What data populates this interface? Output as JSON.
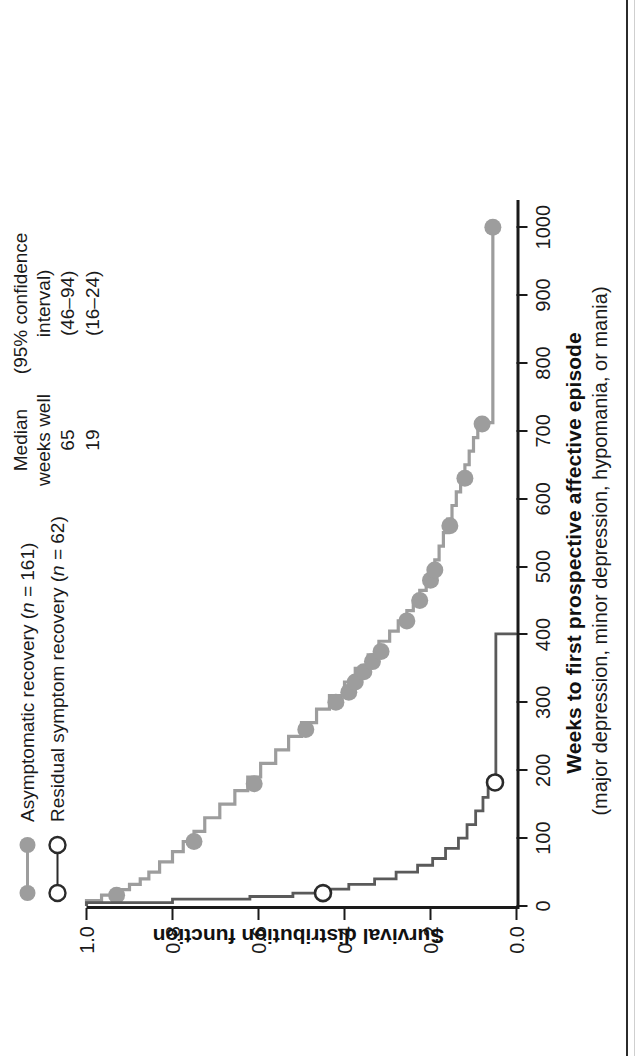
{
  "chart_data": {
    "type": "line",
    "title": "",
    "xlabel": "Weeks to first prospective affective episode",
    "xsublabel": "(major depression, minor depression, hypomania, or mania)",
    "ylabel": "Survival distribution function",
    "xlim": [
      0,
      1040
    ],
    "ylim": [
      0,
      1.0
    ],
    "xticks": [
      0,
      100,
      200,
      300,
      400,
      500,
      600,
      700,
      800,
      900,
      1000
    ],
    "xticklabels": [
      "0",
      "100",
      "200",
      "300",
      "400",
      "500",
      "600",
      "700",
      "800",
      "900",
      "1000"
    ],
    "yticks": [
      0.0,
      0.2,
      0.4,
      0.6,
      0.8,
      1.0
    ],
    "yticklabels": [
      "0.0",
      "0.2",
      "0.4",
      "0.6",
      "0.8",
      "1.0"
    ],
    "grid": false,
    "legend_position": "top-left",
    "series": [
      {
        "name": "Asymptomatic recovery (n=161)",
        "label_plain": "Asymptomatic recovery (",
        "label_italic": "n",
        "label_tail": " = 161)",
        "color": "#9d9d9d",
        "marker": "filled-circle",
        "points": [
          [
            0,
            1.0
          ],
          [
            8,
            0.965
          ],
          [
            16,
            0.93
          ],
          [
            24,
            0.9
          ],
          [
            32,
            0.875
          ],
          [
            40,
            0.855
          ],
          [
            50,
            0.83
          ],
          [
            65,
            0.8
          ],
          [
            80,
            0.775
          ],
          [
            95,
            0.75
          ],
          [
            110,
            0.725
          ],
          [
            130,
            0.69
          ],
          [
            150,
            0.655
          ],
          [
            170,
            0.625
          ],
          [
            190,
            0.595
          ],
          [
            210,
            0.56
          ],
          [
            230,
            0.53
          ],
          [
            250,
            0.5
          ],
          [
            270,
            0.465
          ],
          [
            290,
            0.435
          ],
          [
            310,
            0.4
          ],
          [
            330,
            0.375
          ],
          [
            350,
            0.345
          ],
          [
            370,
            0.32
          ],
          [
            390,
            0.295
          ],
          [
            405,
            0.275
          ],
          [
            420,
            0.255
          ],
          [
            435,
            0.24
          ],
          [
            450,
            0.225
          ],
          [
            465,
            0.21
          ],
          [
            480,
            0.2
          ],
          [
            495,
            0.19
          ],
          [
            510,
            0.18
          ],
          [
            530,
            0.17
          ],
          [
            550,
            0.16
          ],
          [
            570,
            0.15
          ],
          [
            590,
            0.14
          ],
          [
            610,
            0.13
          ],
          [
            630,
            0.12
          ],
          [
            650,
            0.11
          ],
          [
            670,
            0.1
          ],
          [
            690,
            0.09
          ],
          [
            710,
            0.08
          ],
          [
            712,
            0.055
          ],
          [
            1000,
            0.055
          ]
        ],
        "censored": [
          [
            16,
            0.93
          ],
          [
            95,
            0.75
          ],
          [
            180,
            0.61
          ],
          [
            260,
            0.49
          ],
          [
            300,
            0.42
          ],
          [
            315,
            0.39
          ],
          [
            330,
            0.375
          ],
          [
            345,
            0.355
          ],
          [
            360,
            0.335
          ],
          [
            375,
            0.315
          ],
          [
            420,
            0.255
          ],
          [
            450,
            0.225
          ],
          [
            480,
            0.2
          ],
          [
            495,
            0.19
          ],
          [
            560,
            0.155
          ],
          [
            630,
            0.12
          ],
          [
            710,
            0.08
          ],
          [
            1000,
            0.055
          ]
        ]
      },
      {
        "name": "Residual symptom recovery (n=62)",
        "label_plain": "Residual symptom recovery (",
        "label_italic": "n",
        "label_tail": " = 62)",
        "color": "#5a5a5a",
        "marker": "open-circle",
        "points": [
          [
            0,
            1.0
          ],
          [
            5,
            0.8
          ],
          [
            10,
            0.62
          ],
          [
            14,
            0.52
          ],
          [
            19,
            0.45
          ],
          [
            25,
            0.39
          ],
          [
            32,
            0.33
          ],
          [
            40,
            0.28
          ],
          [
            50,
            0.23
          ],
          [
            60,
            0.195
          ],
          [
            70,
            0.165
          ],
          [
            85,
            0.135
          ],
          [
            100,
            0.115
          ],
          [
            120,
            0.095
          ],
          [
            140,
            0.078
          ],
          [
            160,
            0.066
          ],
          [
            180,
            0.057
          ],
          [
            185,
            0.048
          ],
          [
            250,
            0.048
          ],
          [
            320,
            0.048
          ],
          [
            400,
            0.048
          ],
          [
            401,
            0.0
          ]
        ],
        "censored": [
          [
            19,
            0.45
          ],
          [
            182,
            0.05
          ]
        ]
      }
    ]
  },
  "legend": {
    "rows": [
      {
        "marker": "filled-circle",
        "color": "#9d9d9d",
        "text_before": "Asymptomatic recovery (",
        "italic": "n",
        "text_after": " = 161)"
      },
      {
        "marker": "open-circle",
        "color": "#2b2b2b",
        "text_before": "Residual symptom recovery (",
        "italic": "n",
        "text_after": " = 62)"
      }
    ]
  },
  "stats": {
    "headers": [
      "Median\nweeks well",
      "(95% confidence\ninterval)"
    ],
    "header_median_line1": "Median",
    "header_median_line2": "weeks well",
    "header_ci_line1": "(95% confidence",
    "header_ci_line2": "interval)",
    "rows": [
      {
        "median": "65",
        "ci": "(46–94)"
      },
      {
        "median": "19",
        "ci": "(16–24)"
      }
    ]
  }
}
